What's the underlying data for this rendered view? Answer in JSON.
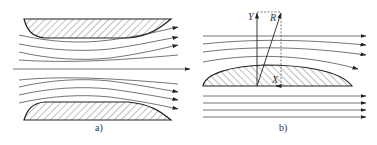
{
  "figure": {
    "panel_a": {
      "caption": "a)",
      "description": "Flow between two converging-diverging hatched bodies, with a central straight streamline and curved streamlines on both sides"
    },
    "panel_b": {
      "caption": "b)",
      "description": "Flow over a single hatched airfoil-like body with resultant force decomposition",
      "vectors": {
        "lift_label": "Y",
        "resultant_label": "R",
        "drag_label": "X"
      }
    },
    "colors": {
      "line": "#3a3a3a",
      "outline": "#222222",
      "background": "#ffffff"
    }
  }
}
